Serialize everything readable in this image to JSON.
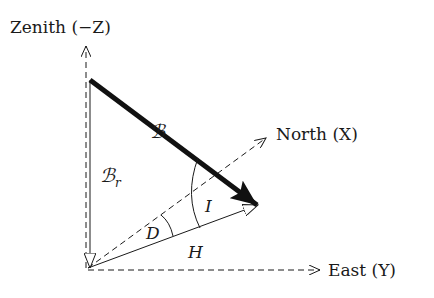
{
  "diagram": {
    "axes": {
      "zenith": {
        "label": "Zenith (−Z)"
      },
      "north": {
        "label": "North (X)"
      },
      "east": {
        "label": "East (Y)"
      }
    },
    "vectors": {
      "total_field": {
        "label": "ℬ"
      },
      "radial": {
        "label": "ℬ",
        "subscript": "r"
      },
      "horizontal": {
        "label": "H"
      }
    },
    "angles": {
      "inclination": {
        "label": "I"
      },
      "declination": {
        "label": "D"
      }
    },
    "colors": {
      "ink": "#1a1a1a",
      "background": "#ffffff"
    }
  }
}
